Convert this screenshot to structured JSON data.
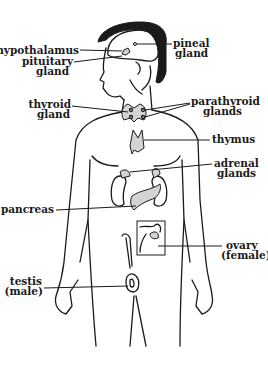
{
  "diagram": {
    "labels": {
      "hypothalamus": "hypothalamus",
      "pituitary_1": "pituitary",
      "pituitary_2": "gland",
      "pineal_1": "pineal",
      "pineal_2": "gland",
      "thyroid_1": "thyroid",
      "thyroid_2": "gland",
      "parathyroid_1": "parathyroid",
      "parathyroid_2": "glands",
      "thymus": "thymus",
      "adrenal_1": "adrenal",
      "adrenal_2": "glands",
      "pancreas": "pancreas",
      "ovary_1": "ovary",
      "ovary_2": "(female)",
      "testis_1": "testis",
      "testis_2": "(male)"
    },
    "colors": {
      "ink": "#1a1a1a",
      "organ_fill": "#d4d4d4",
      "background": "#ffffff"
    }
  }
}
